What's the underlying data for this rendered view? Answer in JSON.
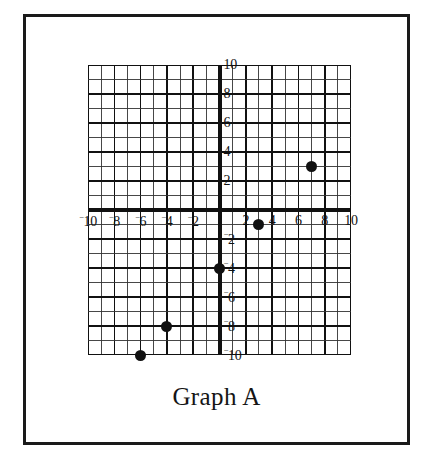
{
  "caption": "Graph A",
  "chart_data": {
    "type": "scatter",
    "title": "Graph A",
    "xlabel": "",
    "ylabel": "",
    "xlim": [
      -10,
      10
    ],
    "ylim": [
      -10,
      10
    ],
    "grid": true,
    "grid_step": 1,
    "major_grid_step": 2,
    "legend": "none",
    "axes_origin": [
      0,
      0
    ],
    "x_tick_values": [
      -10,
      -8,
      -6,
      -4,
      -2,
      2,
      4,
      6,
      8,
      10
    ],
    "y_tick_values": [
      10,
      8,
      6,
      4,
      2,
      -2,
      -4,
      -6,
      -8,
      -10
    ],
    "x_tick_labels": [
      {
        "value": -10,
        "neg": "⁻",
        "text": "10"
      },
      {
        "value": -8,
        "neg": "⁻",
        "text": "8"
      },
      {
        "value": -6,
        "neg": "⁻",
        "text": "6"
      },
      {
        "value": -4,
        "neg": "⁻",
        "text": "4"
      },
      {
        "value": -2,
        "neg": "⁻",
        "text": "2"
      },
      {
        "value": 2,
        "neg": "",
        "text": "2"
      },
      {
        "value": 4,
        "neg": "",
        "text": "4"
      },
      {
        "value": 6,
        "neg": "",
        "text": "6"
      },
      {
        "value": 8,
        "neg": "",
        "text": "8"
      },
      {
        "value": 10,
        "neg": "",
        "text": "10"
      }
    ],
    "y_tick_labels": [
      {
        "value": 10,
        "neg": "",
        "text": "10"
      },
      {
        "value": 8,
        "neg": "",
        "text": "8"
      },
      {
        "value": 6,
        "neg": "",
        "text": "6"
      },
      {
        "value": 4,
        "neg": "",
        "text": "4"
      },
      {
        "value": 2,
        "neg": "",
        "text": "2"
      },
      {
        "value": -2,
        "neg": "⁻",
        "text": "2"
      },
      {
        "value": -4,
        "neg": "⁻",
        "text": "4"
      },
      {
        "value": -6,
        "neg": "⁻",
        "text": "6"
      },
      {
        "value": -8,
        "neg": "⁻",
        "text": "8"
      },
      {
        "value": -10,
        "neg": "⁻",
        "text": "10"
      }
    ],
    "points": [
      {
        "x": 7,
        "y": 3
      },
      {
        "x": 3,
        "y": -1
      },
      {
        "x": 0,
        "y": -4
      },
      {
        "x": -4,
        "y": -8
      },
      {
        "x": -6,
        "y": -10
      }
    ],
    "colors": {
      "point": "#111111",
      "axis": "#111111",
      "grid_minor": "#333333",
      "grid_major": "#111111",
      "frame": "#1a1a1a",
      "background": "#ffffff"
    }
  }
}
